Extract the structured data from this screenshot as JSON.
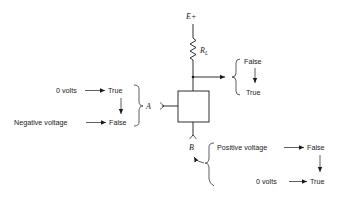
{
  "diagram": {
    "type": "logic-gate-circuit",
    "supply": {
      "label": "E+"
    },
    "resistor": {
      "label": "R",
      "subscript": "L"
    },
    "output": {
      "states": [
        "False",
        "True"
      ]
    },
    "input_a": {
      "label": "A",
      "mappings": [
        {
          "voltage": "0 volts",
          "logic": "True"
        },
        {
          "voltage": "Negative voltage",
          "logic": "False"
        }
      ]
    },
    "input_b": {
      "label": "B",
      "mappings": [
        {
          "voltage": "Positive voltage",
          "logic": "False"
        },
        {
          "voltage": "0 volts",
          "logic": "True"
        }
      ]
    },
    "colors": {
      "ink": "#1a1a1a",
      "background": "#ffffff"
    }
  }
}
